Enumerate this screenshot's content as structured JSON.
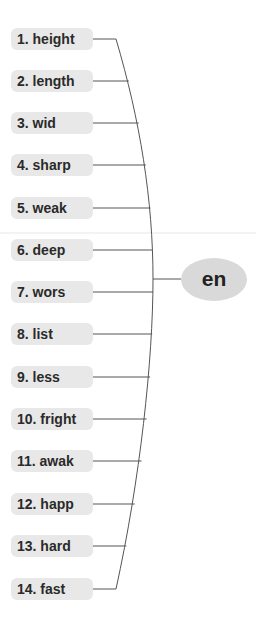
{
  "diagram": {
    "type": "mind-map",
    "center": {
      "label": "en",
      "color": "#d9d9d9"
    },
    "node_color": "#e8e8e8",
    "line_color": "#555555",
    "branches": [
      {
        "label": "1. height",
        "y": 39
      },
      {
        "label": "2. length",
        "y": 81
      },
      {
        "label": "3. wid",
        "y": 123
      },
      {
        "label": "4. sharp",
        "y": 165
      },
      {
        "label": "5. weak",
        "y": 208
      },
      {
        "label": "6. deep",
        "y": 250
      },
      {
        "label": "7. wors",
        "y": 292
      },
      {
        "label": "8. list",
        "y": 334
      },
      {
        "label": "9. less",
        "y": 377
      },
      {
        "label": "10. fright",
        "y": 419
      },
      {
        "label": "11. awak",
        "y": 461
      },
      {
        "label": "12. happ",
        "y": 504
      },
      {
        "label": "13. hard",
        "y": 546
      },
      {
        "label": "14. fast",
        "y": 589
      }
    ]
  }
}
